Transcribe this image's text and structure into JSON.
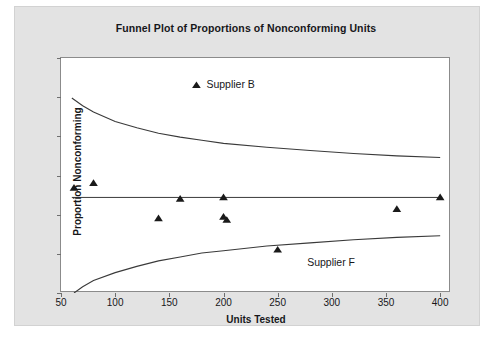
{
  "chart_data": {
    "type": "scatter",
    "title": "Funnel Plot of Proportions of Nonconforming Units",
    "xlabel": "Units Tested",
    "ylabel": "Proportion Nonconforming",
    "xlim": [
      50,
      410
    ],
    "ylim": [
      0.0,
      0.3
    ],
    "xticks": [
      50,
      100,
      150,
      200,
      250,
      300,
      350,
      400
    ],
    "xtick_labels": [
      "50",
      "100",
      "150",
      "200",
      "250",
      "300",
      "350",
      "400"
    ],
    "yticks": [
      0.0,
      0.05,
      0.1,
      0.15,
      0.2,
      0.25,
      0.3
    ],
    "ytick_labels": [
      "0.00",
      "0.05",
      "0.10",
      "0.15",
      "0.20",
      "0.25",
      "0.30"
    ],
    "grid": false,
    "legend_position": "inside-top-center",
    "marker": "triangle",
    "marker_color": "#1a1a1a",
    "line_color": "#3a3a3a",
    "center_line_value": 0.122,
    "points": [
      {
        "x": 62,
        "y": 0.134
      },
      {
        "x": 80,
        "y": 0.14
      },
      {
        "x": 140,
        "y": 0.095
      },
      {
        "x": 160,
        "y": 0.12
      },
      {
        "x": 200,
        "y": 0.122
      },
      {
        "x": 200,
        "y": 0.097
      },
      {
        "x": 203,
        "y": 0.093
      },
      {
        "x": 250,
        "y": 0.055
      },
      {
        "x": 360,
        "y": 0.107
      },
      {
        "x": 400,
        "y": 0.122
      }
    ],
    "upper_limit_curve": [
      {
        "x": 60,
        "y": 0.249
      },
      {
        "x": 70,
        "y": 0.239
      },
      {
        "x": 80,
        "y": 0.231
      },
      {
        "x": 100,
        "y": 0.219
      },
      {
        "x": 120,
        "y": 0.211
      },
      {
        "x": 140,
        "y": 0.204
      },
      {
        "x": 160,
        "y": 0.199
      },
      {
        "x": 180,
        "y": 0.195
      },
      {
        "x": 200,
        "y": 0.191
      },
      {
        "x": 240,
        "y": 0.186
      },
      {
        "x": 280,
        "y": 0.182
      },
      {
        "x": 320,
        "y": 0.178
      },
      {
        "x": 360,
        "y": 0.175
      },
      {
        "x": 400,
        "y": 0.173
      }
    ],
    "lower_limit_curve": [
      {
        "x": 62,
        "y": 0.0
      },
      {
        "x": 70,
        "y": 0.008
      },
      {
        "x": 80,
        "y": 0.016
      },
      {
        "x": 100,
        "y": 0.026
      },
      {
        "x": 120,
        "y": 0.034
      },
      {
        "x": 140,
        "y": 0.041
      },
      {
        "x": 160,
        "y": 0.046
      },
      {
        "x": 180,
        "y": 0.051
      },
      {
        "x": 200,
        "y": 0.054
      },
      {
        "x": 240,
        "y": 0.06
      },
      {
        "x": 280,
        "y": 0.064
      },
      {
        "x": 320,
        "y": 0.068
      },
      {
        "x": 360,
        "y": 0.071
      },
      {
        "x": 400,
        "y": 0.073
      }
    ],
    "annotations": [
      {
        "name": "supplier-b",
        "text": "Supplier B",
        "x": 175,
        "y": 0.265,
        "marker": true
      },
      {
        "name": "supplier-f",
        "text": "Supplier F",
        "x": 268,
        "y": 0.038,
        "marker": false
      }
    ]
  }
}
